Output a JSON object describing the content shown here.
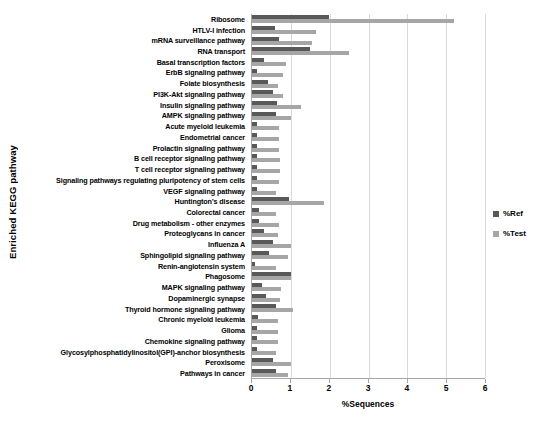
{
  "chart_data": {
    "type": "bar",
    "orientation": "horizontal",
    "title": "",
    "xlabel": "%Sequences",
    "ylabel": "Enriched KEGG pathway",
    "xlim": [
      0,
      6
    ],
    "xticks": [
      0,
      1,
      2,
      3,
      4,
      5,
      6
    ],
    "grid": true,
    "legend_position": "right",
    "categories": [
      "Ribosome",
      "HTLV-I infection",
      "mRNA surveillance pathway",
      "RNA transport",
      "Basal transcription factors",
      "ErbB signaling pathway",
      "Folate biosynthesis",
      "PI3K-Akt signaling pathway",
      "Insulin signaling pathway",
      "AMPK signaling pathway",
      "Acute myeloid leukemia",
      "Endometrial cancer",
      "Prolactin signaling pathway",
      "B cell receptor signaling pathway",
      "T cell receptor signaling pathway",
      "Signaling pathways regulating pluripotency of stem cells",
      "VEGF signaling pathway",
      "Huntington's disease",
      "Colorectal cancer",
      "Drug metabolism - other enzymes",
      "Proteoglycans in cancer",
      "Influenza A",
      "Sphingolipid signaling pathway",
      "Renin-angiotensin system",
      "Phagosome",
      "MAPK signaling pathway",
      "Dopaminergic synapse",
      "Thyroid hormone signaling pathway",
      "Chronic myeloid leukemia",
      "Glioma",
      "Chemokine signaling pathway",
      "Glycosylphosphatidylinositol(GPI)-anchor biosynthesis",
      "Peroxisome",
      "Pathways in cancer"
    ],
    "series": [
      {
        "name": "%Ref",
        "color": "#595959",
        "values": [
          1.98,
          0.6,
          0.7,
          1.5,
          0.3,
          0.13,
          0.42,
          0.55,
          0.65,
          0.62,
          0.13,
          0.13,
          0.13,
          0.13,
          0.13,
          0.13,
          0.13,
          0.95,
          0.18,
          0.18,
          0.3,
          0.55,
          0.45,
          0.08,
          1.0,
          0.25,
          0.35,
          0.62,
          0.15,
          0.13,
          0.13,
          0.13,
          0.55,
          0.62
        ]
      },
      {
        "name": "%Test",
        "color": "#a6a6a6",
        "values": [
          5.2,
          1.65,
          1.55,
          2.5,
          0.88,
          0.8,
          0.68,
          0.8,
          1.25,
          1.0,
          0.7,
          0.7,
          0.7,
          0.72,
          0.72,
          0.7,
          0.62,
          1.85,
          0.62,
          0.7,
          0.68,
          1.0,
          0.92,
          0.62,
          1.0,
          0.75,
          0.72,
          1.05,
          0.68,
          0.68,
          0.68,
          0.62,
          1.0,
          0.92
        ]
      }
    ]
  },
  "legend": {
    "items": [
      {
        "label": "%Ref",
        "color": "#595959"
      },
      {
        "label": "%Test",
        "color": "#a6a6a6"
      }
    ]
  }
}
